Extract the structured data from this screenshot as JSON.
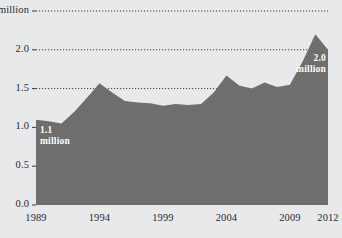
{
  "chart_data": {
    "type": "area",
    "title": "",
    "subtitle": "",
    "xlabel": "",
    "ylabel": "",
    "x": [
      1989,
      1990,
      1991,
      1992,
      1993,
      1994,
      1995,
      1996,
      1997,
      1998,
      1999,
      2000,
      2001,
      2002,
      2003,
      2004,
      2005,
      2006,
      2007,
      2008,
      2009,
      2010,
      2011,
      2012
    ],
    "values": [
      1.1,
      1.08,
      1.05,
      1.2,
      1.38,
      1.57,
      1.45,
      1.34,
      1.32,
      1.31,
      1.28,
      1.3,
      1.29,
      1.3,
      1.45,
      1.67,
      1.54,
      1.5,
      1.58,
      1.52,
      1.55,
      1.85,
      2.2,
      2.0
    ],
    "units": "million",
    "xlim": [
      1989,
      2012
    ],
    "ylim": [
      0.0,
      2.5
    ],
    "grid": true,
    "grid_style": "dotted",
    "legend": "none",
    "y_ticks": [
      {
        "value": 2.5,
        "label": "2.5 million"
      },
      {
        "value": 2.0,
        "label": "2.0"
      },
      {
        "value": 1.5,
        "label": "1.5"
      },
      {
        "value": 1.0,
        "label": "1.0"
      },
      {
        "value": 0.5,
        "label": "0.5"
      },
      {
        "value": 0.0,
        "label": "0.0"
      }
    ],
    "x_ticks": [
      {
        "value": 1989,
        "label": "1989"
      },
      {
        "value": 1994,
        "label": "1994"
      },
      {
        "value": 1999,
        "label": "1999"
      },
      {
        "value": 2004,
        "label": "2004"
      },
      {
        "value": 2009,
        "label": "2009"
      },
      {
        "value": 2012,
        "label": "2012"
      }
    ],
    "annotations": [
      {
        "id": "start-value",
        "line1": "1.1",
        "line2": "million",
        "at_x": 1989,
        "at_y": 1.1
      },
      {
        "id": "end-value",
        "line1": "2.0",
        "line2": "million",
        "at_x": 2012,
        "at_y": 2.0
      }
    ],
    "colors": {
      "area_fill": "#6e6e6e",
      "background": "#e8e9ea",
      "grid": "#3a3a3a",
      "axis_text": "#2a2a2a",
      "annotation_text": "#ffffff"
    }
  }
}
